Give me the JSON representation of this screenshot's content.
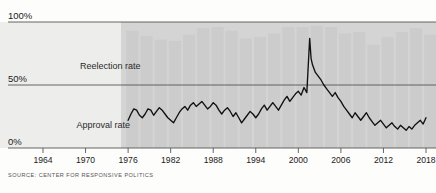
{
  "chart_data": {
    "type": "bar",
    "title": "",
    "subtitle": "",
    "xlabel": "",
    "ylabel": "",
    "grid": true,
    "legend_position": "inline-annotations",
    "ylim": [
      0,
      100
    ],
    "ytick_labels": [
      "0%",
      "50%",
      "100%"
    ],
    "ytick_values": [
      0,
      50,
      100
    ],
    "xlim": [
      1962,
      2019
    ],
    "xtick_labels": [
      "1964",
      "1970",
      "1976",
      "1982",
      "1988",
      "1994",
      "2000",
      "2006",
      "2012",
      "2018"
    ],
    "xtick_values": [
      1964,
      1970,
      1976,
      1982,
      1988,
      1994,
      2000,
      2006,
      2012,
      2018
    ],
    "annotations": [
      {
        "text": "Reelection rate",
        "x": 1973.5,
        "y": 63
      },
      {
        "text": "Approval rate",
        "x": 1972.5,
        "y": 16
      }
    ],
    "source": "SOURCE: CENTER FOR RESPONSIVE POLITICS",
    "colors": {
      "bar": "#cccccc",
      "line": "#111111",
      "panel": "#d4d4d4",
      "panel_left": "#ededec",
      "gridline": "#555555",
      "axis": "#555555",
      "text": "#1b1b1b"
    },
    "series": [
      {
        "name": "Reelection rate",
        "type": "bar",
        "categories": [
          1976,
          1978,
          1980,
          1982,
          1984,
          1986,
          1988,
          1990,
          1992,
          1994,
          1996,
          1998,
          2000,
          2002,
          2004,
          2006,
          2008,
          2010,
          2012,
          2014,
          2016,
          2018
        ],
        "values": [
          93,
          89,
          86,
          85,
          90,
          95,
          96,
          93,
          87,
          88,
          91,
          96,
          96,
          97,
          96,
          91,
          92,
          82,
          88,
          92,
          95,
          90
        ]
      },
      {
        "name": "Approval rate",
        "type": "line",
        "x": [
          1976.0,
          1976.4,
          1976.8,
          1977.2,
          1977.6,
          1978.0,
          1978.4,
          1978.8,
          1979.2,
          1979.6,
          1980.0,
          1980.4,
          1980.8,
          1981.2,
          1981.6,
          1982.0,
          1982.4,
          1982.8,
          1983.2,
          1983.6,
          1984.0,
          1984.4,
          1984.8,
          1985.2,
          1985.6,
          1986.0,
          1986.4,
          1986.8,
          1987.2,
          1987.6,
          1988.0,
          1988.4,
          1988.8,
          1989.2,
          1989.6,
          1990.0,
          1990.4,
          1990.8,
          1991.2,
          1991.6,
          1992.0,
          1992.4,
          1992.8,
          1993.2,
          1993.6,
          1994.0,
          1994.4,
          1994.8,
          1995.2,
          1995.6,
          1996.0,
          1996.4,
          1996.8,
          1997.2,
          1997.6,
          1998.0,
          1998.4,
          1998.8,
          1999.2,
          1999.6,
          2000.0,
          2000.4,
          2000.8,
          2001.2,
          2001.6,
          2001.8,
          2002.0,
          2002.4,
          2002.8,
          2003.2,
          2003.6,
          2004.0,
          2004.4,
          2004.8,
          2005.2,
          2005.6,
          2006.0,
          2006.4,
          2006.8,
          2007.2,
          2007.6,
          2008.0,
          2008.4,
          2008.8,
          2009.2,
          2009.6,
          2010.0,
          2010.4,
          2010.8,
          2011.2,
          2011.6,
          2012.0,
          2012.4,
          2012.8,
          2013.2,
          2013.6,
          2014.0,
          2014.4,
          2014.8,
          2015.2,
          2015.6,
          2016.0,
          2016.4,
          2016.8,
          2017.2,
          2017.6,
          2018.0
        ],
        "y": [
          22,
          27,
          31,
          30,
          26,
          24,
          27,
          31,
          30,
          26,
          29,
          32,
          30,
          27,
          24,
          22,
          20,
          24,
          28,
          31,
          33,
          30,
          34,
          36,
          33,
          35,
          37,
          34,
          31,
          33,
          36,
          34,
          30,
          27,
          30,
          32,
          29,
          25,
          28,
          24,
          20,
          23,
          26,
          29,
          27,
          24,
          27,
          31,
          34,
          30,
          33,
          36,
          33,
          30,
          34,
          38,
          41,
          37,
          40,
          43,
          45,
          42,
          48,
          44,
          87,
          71,
          66,
          60,
          57,
          54,
          50,
          47,
          44,
          41,
          44,
          40,
          37,
          33,
          30,
          27,
          24,
          28,
          25,
          22,
          25,
          28,
          24,
          21,
          18,
          20,
          22,
          19,
          16,
          18,
          20,
          17,
          15,
          18,
          16,
          14,
          17,
          15,
          18,
          20,
          22,
          19,
          24
        ]
      }
    ]
  },
  "footer": {
    "source_text": "SOURCE: CENTER FOR RESPONSIVE POLITICS"
  }
}
